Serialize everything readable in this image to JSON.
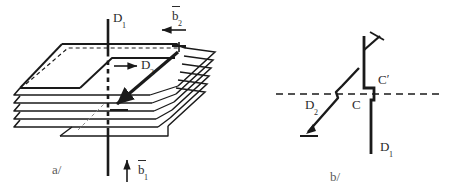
{
  "figure": {
    "type": "diagram",
    "background_color": "#ffffff",
    "ink_color": "#1a1a1a",
    "panels": [
      {
        "id": "a",
        "caption": "a/",
        "description": "perspective view of a stack of lattice planes forming a spiral ramp around a vertical dislocation line",
        "labels": [
          {
            "name": "D1",
            "base": "D",
            "sub": "1",
            "role": "vertical-dislocation-line"
          },
          {
            "name": "D2",
            "base": "D",
            "sub": "2",
            "role": "inclined-dislocation-line"
          },
          {
            "name": "b2",
            "base": "b",
            "sub": "2",
            "overbar": true,
            "role": "burgers-vector",
            "arrow": "left"
          },
          {
            "name": "b1",
            "base": "b",
            "sub": "1",
            "overbar": true,
            "role": "burgers-vector",
            "arrow": "up"
          }
        ],
        "sheet_count": 5
      },
      {
        "id": "b",
        "caption": "b/",
        "description": "schematic side view of the dislocation node with a jog at C, C-prime",
        "labels": [
          {
            "name": "D1",
            "base": "D",
            "sub": "1",
            "role": "vertical-dislocation-line"
          },
          {
            "name": "D2",
            "base": "D",
            "sub": "2",
            "role": "inclined-dislocation-line"
          },
          {
            "name": "C",
            "base": "C",
            "sub": "",
            "role": "node-point"
          },
          {
            "name": "Cprime",
            "base": "C",
            "sub": "",
            "prime": "′",
            "role": "node-point-prime"
          }
        ]
      }
    ]
  },
  "panel_a": {
    "label_D1": "D",
    "label_D1_sub": "1",
    "label_D2": "D",
    "label_D2_sub": "2",
    "label_b2": "b",
    "label_b2_sub": "2",
    "label_b1": "b",
    "label_b1_sub": "1",
    "caption": "a/"
  },
  "panel_b": {
    "label_D1": "D",
    "label_D1_sub": "1",
    "label_D2": "D",
    "label_D2_sub": "2",
    "label_C": "C",
    "label_Cprime": "C",
    "label_prime_mark": "′",
    "caption": "b/"
  },
  "colors": {
    "ink": "#1a1a1a",
    "ink_soft": "#2b2b2b",
    "caption": "#5a5a5a",
    "background": "#ffffff"
  }
}
